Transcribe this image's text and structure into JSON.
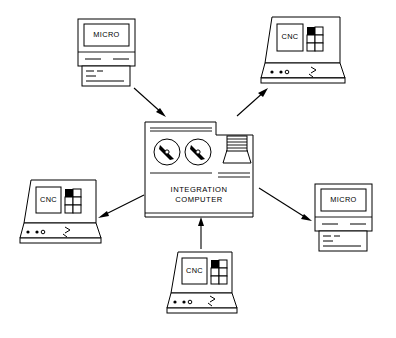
{
  "diagram": {
    "background_color": "#ffffff",
    "line_color": "#000000",
    "hub": {
      "label_line1": "INTEGRATION",
      "label_line2": "COMPUTER",
      "parts": {
        "tape_reel_left": "tape-reel-icon",
        "tape_reel_right": "tape-reel-icon",
        "printer_stack": "printer-stack-icon"
      }
    },
    "nodes": [
      {
        "id": "micro-top-left",
        "label": "MICRO",
        "type": "micro",
        "position": "top-left"
      },
      {
        "id": "cnc-top-right",
        "label": "CNC",
        "type": "cnc",
        "position": "top-right"
      },
      {
        "id": "cnc-left",
        "label": "CNC",
        "type": "cnc",
        "position": "left"
      },
      {
        "id": "micro-right",
        "label": "MICRO",
        "type": "micro",
        "position": "right"
      },
      {
        "id": "cnc-bottom",
        "label": "CNC",
        "type": "cnc",
        "position": "bottom"
      }
    ],
    "links": [
      {
        "id": "link-micro-top-left",
        "from": "micro-top-left",
        "to": "hub",
        "direction": "to-hub"
      },
      {
        "id": "link-cnc-top-right",
        "from": "hub",
        "to": "cnc-top-right",
        "direction": "to-node"
      },
      {
        "id": "link-cnc-left",
        "from": "hub",
        "to": "cnc-left",
        "direction": "to-node"
      },
      {
        "id": "link-micro-right",
        "from": "hub",
        "to": "micro-right",
        "direction": "to-node"
      },
      {
        "id": "link-cnc-bottom",
        "from": "cnc-bottom",
        "to": "hub",
        "direction": "to-hub"
      }
    ]
  }
}
